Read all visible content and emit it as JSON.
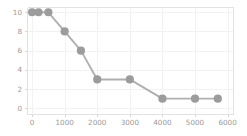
{
  "chart_data": {
    "type": "line",
    "title": "",
    "subtitle": "",
    "xlabel": "",
    "ylabel": "",
    "xlim": [
      -170,
      6150
    ],
    "ylim": [
      -0.55,
      10.6
    ],
    "grid": true,
    "legend": null,
    "legend_position": "none",
    "x_ticks": [
      0,
      1000,
      2000,
      3000,
      4000,
      5000,
      6000
    ],
    "x_tick_labels": [
      "0",
      "1000",
      "2000",
      "3000",
      "4000",
      "5000",
      "6000"
    ],
    "y_ticks": [
      0,
      2,
      4,
      6,
      8,
      10
    ],
    "y_tick_labels": [
      "0",
      "2",
      "4",
      "6",
      "8",
      "10"
    ],
    "series": [
      {
        "name": "series-1",
        "color": "#9c9c9c",
        "line_color": "#b0b0b0",
        "marker": "circle",
        "points": [
          {
            "x": 0,
            "y": 10
          },
          {
            "x": 200,
            "y": 10
          },
          {
            "x": 500,
            "y": 10
          },
          {
            "x": 1000,
            "y": 8
          },
          {
            "x": 1500,
            "y": 6
          },
          {
            "x": 2000,
            "y": 3
          },
          {
            "x": 3000,
            "y": 3
          },
          {
            "x": 4000,
            "y": 1
          },
          {
            "x": 5000,
            "y": 1
          },
          {
            "x": 5700,
            "y": 1
          }
        ]
      }
    ],
    "colors": {
      "marker": "#9c9c9c",
      "line": "#b0b0b0",
      "grid": "#f2f2f2",
      "spine": "#e2e2e2",
      "tick_label": "#9a9a9a",
      "background": "#ffffff"
    }
  }
}
